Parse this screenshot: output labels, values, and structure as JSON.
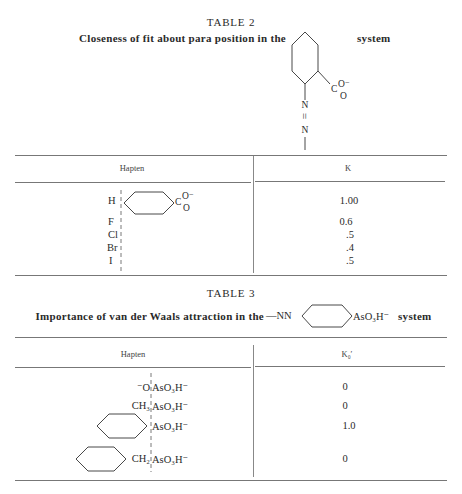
{
  "table2": {
    "title": "TABLE 2",
    "caption_before": "Closeness of fit about para position in the",
    "caption_after": "system",
    "structure": {
      "ring": "benzene-ring-icon",
      "carboxylate_c": "C",
      "carboxylate_o_minus": "O⁻",
      "carboxylate_o": "O",
      "n1": "N",
      "double_bond": "=",
      "n2": "N"
    },
    "headers": [
      "Hapten",
      "K"
    ],
    "hapten_ring": {
      "c": "C",
      "o_minus": "O⁻",
      "o": "O"
    },
    "rows": [
      {
        "substituent": "H",
        "k": "1.00"
      },
      {
        "substituent": "F",
        "k": "0.6"
      },
      {
        "substituent": "Cl",
        "k": ".5"
      },
      {
        "substituent": "Br",
        "k": ".4"
      },
      {
        "substituent": "I",
        "k": ".5"
      }
    ]
  },
  "table3": {
    "title": "TABLE 3",
    "caption_before": "Importance of van der Waals attraction in the",
    "caption_group": "—NN",
    "caption_tail": "AsO₃H⁻",
    "caption_after": "system",
    "headers": [
      "Hapten",
      "K₀′"
    ],
    "rows": [
      {
        "left": "⁻O",
        "right": "AsO₃H⁻",
        "k": "0",
        "ring": false
      },
      {
        "left": "CH₃",
        "right": "AsO₃H⁻",
        "k": "0",
        "ring": false
      },
      {
        "left": "",
        "right": "AsO₃H⁻",
        "k": "1.0",
        "ring": true
      },
      {
        "left": "CH₂",
        "right": "AsO₃H⁻",
        "k": "0",
        "ring": true
      }
    ]
  }
}
